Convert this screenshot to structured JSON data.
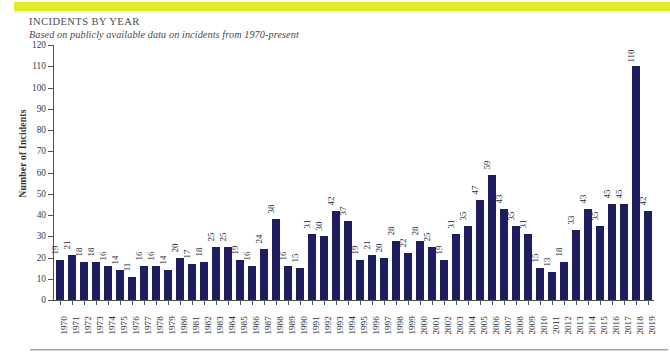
{
  "header": {
    "title": "INCIDENTS BY YEAR",
    "subtitle": "Based on publicly available data on incidents from 1970-present",
    "accent_bar_color": "#e2ea2b"
  },
  "colors": {
    "bar": "#1d1d60",
    "axis": "#53535c",
    "accent": "#e2ea2b",
    "rule": "#8fa4b4",
    "text": "#2a2a33"
  },
  "chart_data": {
    "type": "bar",
    "title": "INCIDENTS BY YEAR",
    "subtitle": "Based on publicly available data on incidents from 1970-present",
    "xlabel": "",
    "ylabel": "Number of Incidents",
    "ylim": [
      0,
      120
    ],
    "ytick_step": 10,
    "yticks": [
      0,
      10,
      20,
      30,
      40,
      50,
      60,
      70,
      80,
      90,
      100,
      110,
      120
    ],
    "grid": false,
    "legend": false,
    "data_labels": true,
    "data_label_orientation": "vertical",
    "categories": [
      "1970",
      "1971",
      "1972",
      "1973",
      "1974",
      "1975",
      "1976",
      "1977",
      "1978",
      "1979",
      "1980",
      "1981",
      "1982",
      "1983",
      "1984",
      "1985",
      "1986",
      "1987",
      "1988",
      "1989",
      "1990",
      "1991",
      "1992",
      "1993",
      "1994",
      "1995",
      "1996",
      "1997",
      "1998",
      "1999",
      "2000",
      "2001",
      "2002",
      "2003",
      "2004",
      "2005",
      "2006",
      "2007",
      "2008",
      "2009",
      "2010",
      "2011",
      "2012",
      "2013",
      "2014",
      "2015",
      "2016",
      "2017",
      "2018",
      "2019"
    ],
    "values": [
      19,
      21,
      18,
      18,
      16,
      14,
      11,
      16,
      16,
      14,
      20,
      17,
      18,
      25,
      25,
      19,
      16,
      24,
      38,
      16,
      15,
      31,
      30,
      42,
      37,
      19,
      21,
      20,
      28,
      22,
      28,
      25,
      19,
      31,
      35,
      47,
      59,
      43,
      35,
      31,
      15,
      13,
      18,
      33,
      43,
      35,
      45,
      45,
      110,
      42
    ]
  }
}
